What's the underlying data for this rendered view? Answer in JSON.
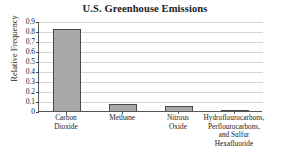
{
  "chart_data": {
    "type": "bar",
    "title": "U.S. Greenhouse Emissions",
    "xlabel": "",
    "ylabel": "Relative Frequency",
    "categories": [
      "Carbon Dioxide",
      "Methane",
      "Nitrous Oxide",
      "Hydroflourocarbons, Perflourocarbons, and Sulfur Hexafluoride"
    ],
    "category_lines": [
      [
        "Carbon",
        "Dioxide"
      ],
      [
        "Methane"
      ],
      [
        "Nitrous",
        "Oxide"
      ],
      [
        "Hydroflourocarbons,",
        "Perflourocarbons,",
        "and Sulfur",
        "Hexafluoride"
      ]
    ],
    "values": [
      0.83,
      0.08,
      0.06,
      0.02
    ],
    "ylim": [
      0,
      0.9
    ],
    "ytick_labels": [
      "0.9",
      "0.8",
      "0.7",
      "0.6",
      "0.5",
      "0.4",
      "0.3",
      "0.2",
      "0.1",
      "0"
    ],
    "ytick_values": [
      0.9,
      0.8,
      0.7,
      0.6,
      0.5,
      0.4,
      0.3,
      0.2,
      0.1,
      0
    ],
    "grid": true,
    "legend": false,
    "bar_fill_color": "#a9a9a9",
    "bar_border_color": "#4a4a4a",
    "gridline_color": "#d7d7d7",
    "axis_color": "#555555",
    "background_color": "#ffffff"
  }
}
